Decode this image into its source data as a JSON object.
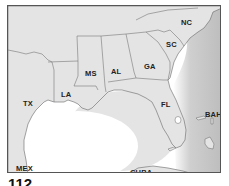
{
  "map": {
    "type": "regional map",
    "region": "Southeastern United States and Gulf of Mexico",
    "labels": {
      "nc": "NC",
      "sc": "SC",
      "ga": "GA",
      "al": "AL",
      "ms": "MS",
      "la": "LA",
      "tx": "TX",
      "fl": "FL",
      "bah": "BAH",
      "mex": "MEX",
      "cuba": "CUBA"
    },
    "colors": {
      "land": "#e4e4e4",
      "water": "#ffffff",
      "shading": "#b8b8b8",
      "border": "#555555"
    }
  },
  "figure": {
    "number": "112"
  }
}
